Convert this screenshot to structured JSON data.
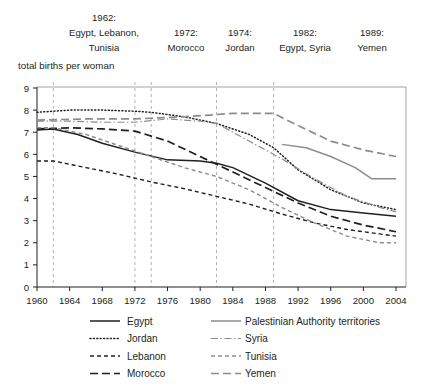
{
  "axis_title": "total births per woman",
  "annotations": [
    {
      "year_label": "1962:",
      "countries_line1": "Egypt, Lebanon,",
      "countries_line2": "Tunisia",
      "year": 1962
    },
    {
      "year_label": "1972:",
      "countries_line1": "",
      "countries_line2": "Morocco",
      "year": 1972
    },
    {
      "year_label": "1974:",
      "countries_line1": "",
      "countries_line2": "Jordan",
      "year": 1974
    },
    {
      "year_label": "1982:",
      "countries_line1": "",
      "countries_line2": "Egypt, Syria",
      "year": 1982
    },
    {
      "year_label": "1989:",
      "countries_line1": "",
      "countries_line2": "Yemen",
      "year": 1989
    }
  ],
  "legend": {
    "column1": [
      {
        "label": "Egypt",
        "style": "solid",
        "color": "#231f20"
      },
      {
        "label": "Jordan",
        "style": "dotted",
        "color": "#231f20"
      },
      {
        "label": "Lebanon",
        "style": "dashed-short",
        "color": "#231f20"
      },
      {
        "label": "Morocco",
        "style": "dashed-long",
        "color": "#231f20"
      }
    ],
    "column2": [
      {
        "label": "Palestinian Authority territories",
        "style": "solid",
        "color": "#8c8c8c"
      },
      {
        "label": "Syria",
        "style": "dashdot",
        "color": "#8c8c8c"
      },
      {
        "label": "Tunisia",
        "style": "dashed-short",
        "color": "#8c8c8c"
      },
      {
        "label": "Yemen",
        "style": "dashed-long",
        "color": "#8c8c8c"
      }
    ]
  },
  "chart_data": {
    "type": "line",
    "title": "",
    "subtitle": "",
    "xlabel": "",
    "ylabel": "total births per woman",
    "xlim": [
      1960,
      2004
    ],
    "ylim": [
      0,
      9
    ],
    "yticks": [
      0,
      1,
      2,
      3,
      4,
      5,
      6,
      7,
      8,
      9
    ],
    "xticks": [
      1960,
      1964,
      1968,
      1972,
      1976,
      1980,
      1984,
      1988,
      1992,
      1996,
      2000,
      2004
    ],
    "grid": "vertical-dashed-at-policy-years",
    "legend_position": "bottom",
    "vertical_markers": [
      1962,
      1972,
      1974,
      1982,
      1989
    ],
    "series": [
      {
        "name": "Egypt",
        "color": "#231f20",
        "style": "solid",
        "x": [
          1960,
          1962,
          1965,
          1968,
          1972,
          1976,
          1980,
          1982,
          1984,
          1988,
          1992,
          1996,
          2000,
          2004
        ],
        "values": [
          7.1,
          7.15,
          6.9,
          6.5,
          6.1,
          5.75,
          5.7,
          5.6,
          5.4,
          4.7,
          3.9,
          3.5,
          3.35,
          3.2
        ]
      },
      {
        "name": "Jordan",
        "color": "#231f20",
        "style": "dotted",
        "x": [
          1960,
          1964,
          1968,
          1972,
          1974,
          1978,
          1982,
          1986,
          1989,
          1992,
          1996,
          2000,
          2004
        ],
        "values": [
          7.9,
          8.0,
          8.0,
          7.95,
          7.9,
          7.7,
          7.4,
          6.9,
          6.3,
          5.3,
          4.4,
          3.8,
          3.5
        ]
      },
      {
        "name": "Lebanon",
        "color": "#231f20",
        "style": "dashed-short",
        "x": [
          1960,
          1962,
          1966,
          1970,
          1974,
          1978,
          1982,
          1986,
          1990,
          1994,
          1998,
          2002,
          2004
        ],
        "values": [
          5.7,
          5.7,
          5.4,
          5.1,
          4.75,
          4.45,
          4.1,
          3.75,
          3.3,
          2.9,
          2.6,
          2.4,
          2.3
        ]
      },
      {
        "name": "Morocco",
        "color": "#231f20",
        "style": "dashed-long",
        "x": [
          1960,
          1964,
          1968,
          1972,
          1976,
          1980,
          1984,
          1988,
          1992,
          1996,
          2000,
          2004
        ],
        "values": [
          7.15,
          7.2,
          7.15,
          7.05,
          6.6,
          5.9,
          5.2,
          4.5,
          3.8,
          3.2,
          2.8,
          2.5
        ]
      },
      {
        "name": "Palestinian Authority territories",
        "color": "#8c8c8c",
        "style": "solid",
        "x": [
          1990,
          1993,
          1996,
          1999,
          2001,
          2004
        ],
        "values": [
          6.45,
          6.3,
          5.9,
          5.4,
          4.9,
          4.9
        ]
      },
      {
        "name": "Syria",
        "color": "#8c8c8c",
        "style": "dashdot",
        "x": [
          1960,
          1964,
          1968,
          1972,
          1976,
          1980,
          1982,
          1986,
          1990,
          1994,
          1998,
          2002,
          2004
        ],
        "values": [
          7.5,
          7.5,
          7.45,
          7.45,
          7.6,
          7.5,
          7.4,
          6.6,
          5.8,
          4.9,
          4.1,
          3.6,
          3.4
        ]
      },
      {
        "name": "Tunisia",
        "color": "#8c8c8c",
        "style": "dashed-short",
        "x": [
          1960,
          1962,
          1966,
          1970,
          1974,
          1978,
          1982,
          1986,
          1990,
          1994,
          1998,
          2002,
          2004
        ],
        "values": [
          7.2,
          7.2,
          6.9,
          6.4,
          5.9,
          5.4,
          5.0,
          4.4,
          3.6,
          2.9,
          2.3,
          2.0,
          2.0
        ]
      },
      {
        "name": "Yemen",
        "color": "#8c8c8c",
        "style": "dashed-long",
        "x": [
          1960,
          1966,
          1972,
          1978,
          1984,
          1989,
          1992,
          1996,
          2000,
          2004
        ],
        "values": [
          7.55,
          7.6,
          7.6,
          7.7,
          7.85,
          7.85,
          7.3,
          6.6,
          6.2,
          5.9
        ]
      }
    ]
  }
}
